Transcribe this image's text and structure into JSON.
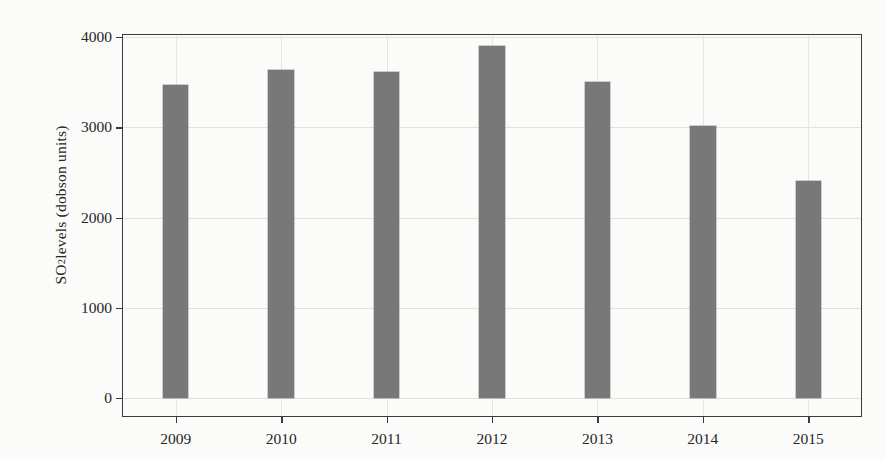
{
  "chart_data": {
    "type": "bar",
    "title": "",
    "xlabel": "",
    "ylabel": "SO2 levels (dobson units)",
    "ylabel_parts": {
      "prefix": "SO",
      "sub": "2",
      "suffix": " levels (dobson units)"
    },
    "categories": [
      "2009",
      "2010",
      "2011",
      "2012",
      "2013",
      "2014",
      "2015"
    ],
    "values": [
      3470,
      3630,
      3610,
      3900,
      3500,
      3010,
      2400
    ],
    "series": [
      {
        "name": "SO2 levels",
        "values": [
          3470,
          3630,
          3610,
          3900,
          3500,
          3010,
          2400
        ]
      }
    ],
    "ylim": [
      0,
      4100
    ],
    "yticks": [
      0,
      1000,
      2000,
      3000,
      4000
    ],
    "ytick_labels": [
      "0",
      "1000",
      "2000",
      "3000",
      "4000"
    ],
    "xtick_labels": [
      "2009",
      "2010",
      "2011",
      "2012",
      "2013",
      "2014",
      "2015"
    ],
    "grid": true,
    "grid_axis": "both",
    "legend": false,
    "legend_position": "none",
    "bar_color": "#787878",
    "frame_color": "#3a3a3a",
    "grid_color": "#e3e1dd",
    "background_color": "#fbfbf9",
    "bar_width_fraction": 0.24
  }
}
